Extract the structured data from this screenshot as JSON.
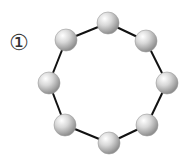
{
  "figure": {
    "label": "①",
    "nodes": [
      {
        "x": 108,
        "y": 23
      },
      {
        "x": 146,
        "y": 41
      },
      {
        "x": 167,
        "y": 83
      },
      {
        "x": 147,
        "y": 125
      },
      {
        "x": 109,
        "y": 143
      },
      {
        "x": 65,
        "y": 125
      },
      {
        "x": 49,
        "y": 83
      },
      {
        "x": 66,
        "y": 40
      }
    ],
    "node_radius": 11,
    "edge_color": "#111111",
    "node_color": "#cfcfcf"
  }
}
